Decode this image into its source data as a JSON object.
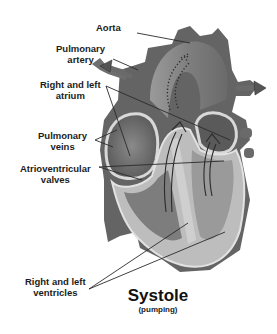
{
  "diagram": {
    "title": "Systole",
    "subtitle": "(pumping)",
    "labels": {
      "aorta": {
        "lines": [
          "Aorta"
        ]
      },
      "pulmonary_artery": {
        "lines": [
          "Pulmonary",
          "artery"
        ]
      },
      "atrium": {
        "lines": [
          "Right and left",
          "atrium"
        ]
      },
      "pulmonary_veins": {
        "lines": [
          "Pulmonary",
          "veins"
        ]
      },
      "av_valves": {
        "lines": [
          "Atrioventricular",
          "valves"
        ]
      },
      "ventricles": {
        "lines": [
          "Right and left",
          "ventricles"
        ]
      }
    },
    "colors": {
      "heart_dark": "#5f5f5f",
      "heart_mid": "#7d7d7d",
      "heart_light": "#b9b9b9",
      "wall_outline": "#dcdcdc",
      "leader_line": "#2a2a2a",
      "background": "#ffffff"
    }
  }
}
